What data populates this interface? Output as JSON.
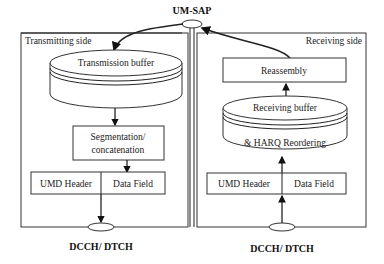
{
  "diagram": {
    "top_label": "UM-SAP",
    "transmit": {
      "side_label": "Transmitting side",
      "buffer": "Transmission buffer",
      "segmentation_line1": "Segmentation/",
      "segmentation_line2": "concatenation",
      "header": "UMD Header",
      "data_field": "Data Field",
      "channel": "DCCH/ DTCH"
    },
    "receive": {
      "side_label": "Receiving side",
      "reassembly": "Reassembly",
      "buffer_line1": "Receiving buffer",
      "buffer_line2": "& HARQ Reordering",
      "header": "UMD Header",
      "data_field": "Data Field",
      "channel": "DCCH/ DTCH"
    }
  }
}
